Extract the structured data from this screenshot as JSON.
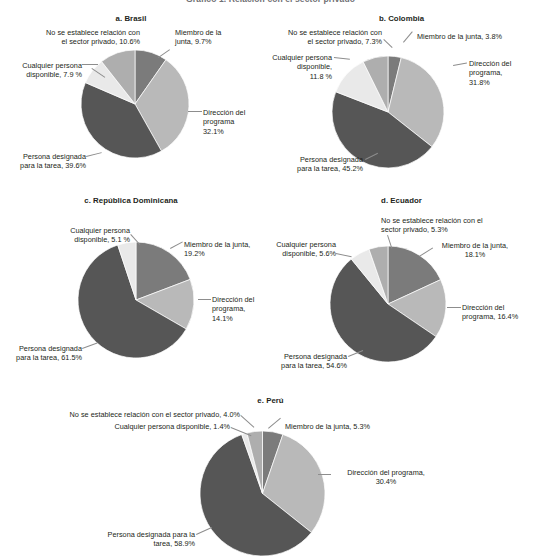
{
  "figure": {
    "title": "Gráfico 1. Relación con el sector privado",
    "background": "#ffffff",
    "text_color": "#231f20"
  },
  "categories": [
    "Miembro de la junta",
    "Dirección del programa",
    "Persona designada para la tarea",
    "Cualquier persona disponible",
    "No se establece relación con el sector privado"
  ],
  "colors": {
    "miembro": "#7b7b7b",
    "direccion": "#b9b9b9",
    "persona_designada": "#565656",
    "cualquier_persona": "#e9e9e9",
    "no_se_establece": "#aeaeae"
  },
  "panels": [
    {
      "key": "brasil",
      "title": "a. Brasil",
      "labels": [
        {
          "name": "no-se-establece",
          "text": "No se establece relación con\nel sector privado, 10.6%"
        },
        {
          "name": "miembro-junta",
          "text": "Miembro de la\njunta, 9.7%"
        },
        {
          "name": "cualquier-persona",
          "text": "Cualquier persona\ndisponible, 7.9 %"
        },
        {
          "name": "direccion-programa",
          "text": "Dirección del\nprograma\n32.1%"
        },
        {
          "name": "persona-designada",
          "text": "Persona designada\npara la tarea, 39.6%"
        }
      ]
    },
    {
      "key": "colombia",
      "title": "b. Colombia",
      "labels": [
        {
          "name": "no-se-establece",
          "text": "No se establece relación con\nel sector privado, 7.3%"
        },
        {
          "name": "miembro-junta",
          "text": "Miembro de la junta, 3.8%"
        },
        {
          "name": "cualquier-persona",
          "text": "Cualquier persona\ndisponible,\n11.8 %"
        },
        {
          "name": "direccion-programa",
          "text": "Dirección del\nprograma,\n31.8%"
        },
        {
          "name": "persona-designada",
          "text": "Persona designada\npara la tarea, 45.2%"
        }
      ]
    },
    {
      "key": "republica-dominicana",
      "title": "c. República Dominicana",
      "labels": [
        {
          "name": "cualquier-persona",
          "text": "Cualquier persona\ndisponible, 5.1 %"
        },
        {
          "name": "miembro-junta",
          "text": "Miembro de la junta,\n19.2%"
        },
        {
          "name": "direccion-programa",
          "text": "Dirección del\nprograma,\n14.1%"
        },
        {
          "name": "persona-designada",
          "text": "Persona designada\npara la tarea, 61.5%"
        }
      ]
    },
    {
      "key": "ecuador",
      "title": "d. Ecuador",
      "labels": [
        {
          "name": "no-se-establece",
          "text": "No se establece relación con el\nsector privado, 5.3%"
        },
        {
          "name": "miembro-junta",
          "text": "Miembro de la junta,\n18.1%"
        },
        {
          "name": "cualquier-persona",
          "text": "Cualquier persona\ndisponible, 5.6%"
        },
        {
          "name": "direccion-programa",
          "text": "Dirección del\nprograma, 16.4%"
        },
        {
          "name": "persona-designada",
          "text": "Persona designada\npara la tarea, 54.6%"
        }
      ]
    },
    {
      "key": "peru",
      "title": "e. Perú",
      "labels": [
        {
          "name": "no-se-establece",
          "text": "No se establece relación con el sector privado, 4.0%"
        },
        {
          "name": "cualquier-persona",
          "text": "Cualquier persona disponible, 1.4%"
        },
        {
          "name": "miembro-junta",
          "text": "Miembro de la junta, 5.3%"
        },
        {
          "name": "direccion-programa",
          "text": "Dirección del programa,\n30.4%"
        },
        {
          "name": "persona-designada",
          "text": "Persona designada para la\ntarea, 58.9%"
        }
      ]
    }
  ],
  "chart_data": [
    {
      "type": "pie",
      "title": "a. Brasil",
      "labels": [
        "Miembro de la junta",
        "Dirección del programa",
        "Persona designada para la tarea",
        "Cualquier persona disponible",
        "No se establece relación con el sector privado"
      ],
      "values": [
        9.7,
        32.1,
        39.6,
        7.9,
        10.6
      ],
      "colors": [
        "#7b7b7b",
        "#b9b9b9",
        "#565656",
        "#e9e9e9",
        "#aeaeae"
      ],
      "units": "percent",
      "start_angle": 0,
      "direction": "clockwise",
      "legend": "none",
      "grid": false
    },
    {
      "type": "pie",
      "title": "b. Colombia",
      "labels": [
        "Miembro de la junta",
        "Dirección del programa",
        "Persona designada para la tarea",
        "Cualquier persona disponible",
        "No se establece relación con el sector privado"
      ],
      "values": [
        3.8,
        31.8,
        45.2,
        11.8,
        7.3
      ],
      "colors": [
        "#7b7b7b",
        "#b9b9b9",
        "#565656",
        "#e9e9e9",
        "#aeaeae"
      ],
      "units": "percent",
      "start_angle": 0,
      "direction": "clockwise",
      "legend": "none",
      "grid": false
    },
    {
      "type": "pie",
      "title": "c. República Dominicana",
      "labels": [
        "Miembro de la junta",
        "Dirección del programa",
        "Persona designada para la tarea",
        "Cualquier persona disponible"
      ],
      "values": [
        19.2,
        14.1,
        61.5,
        5.1
      ],
      "colors": [
        "#7b7b7b",
        "#b9b9b9",
        "#565656",
        "#e9e9e9"
      ],
      "units": "percent",
      "start_angle": 0,
      "direction": "clockwise",
      "legend": "none",
      "grid": false
    },
    {
      "type": "pie",
      "title": "d. Ecuador",
      "labels": [
        "Miembro de la junta",
        "Dirección del programa",
        "Persona designada para la tarea",
        "Cualquier persona disponible",
        "No se establece relación con el sector privado"
      ],
      "values": [
        18.1,
        16.4,
        54.6,
        5.6,
        5.3
      ],
      "colors": [
        "#7b7b7b",
        "#b9b9b9",
        "#565656",
        "#e9e9e9",
        "#aeaeae"
      ],
      "units": "percent",
      "start_angle": 0,
      "direction": "clockwise",
      "legend": "none",
      "grid": false
    },
    {
      "type": "pie",
      "title": "e. Perú",
      "labels": [
        "Miembro de la junta",
        "Dirección del programa",
        "Persona designada para la tarea",
        "Cualquier persona disponible",
        "No se establece relación con el sector privado"
      ],
      "values": [
        5.3,
        30.4,
        58.9,
        1.4,
        4.0
      ],
      "colors": [
        "#7b7b7b",
        "#b9b9b9",
        "#565656",
        "#e9e9e9",
        "#aeaeae"
      ],
      "units": "percent",
      "start_angle": 0,
      "direction": "clockwise",
      "legend": "none",
      "grid": false
    }
  ]
}
